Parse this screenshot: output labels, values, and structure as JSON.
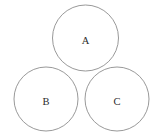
{
  "diagram": {
    "type": "venn-like-circle-arrangement",
    "title": "",
    "background_color": "#ffffff",
    "stroke_color": "#8d8d8d",
    "label_color": "#2b2b2b",
    "stroke_width": 0.9,
    "canvas": {
      "width": 164,
      "height": 137
    },
    "circles": [
      {
        "id": "circle-a",
        "label": "A",
        "cx": 85.5,
        "cy": 38,
        "r": 33,
        "label_x": 85.5,
        "label_y": 40
      },
      {
        "id": "circle-b",
        "label": "B",
        "cx": 46,
        "cy": 99,
        "r": 32,
        "label_x": 46,
        "label_y": 101
      },
      {
        "id": "circle-c",
        "label": "C",
        "cx": 117,
        "cy": 99,
        "r": 32,
        "label_x": 117,
        "label_y": 101
      }
    ]
  }
}
